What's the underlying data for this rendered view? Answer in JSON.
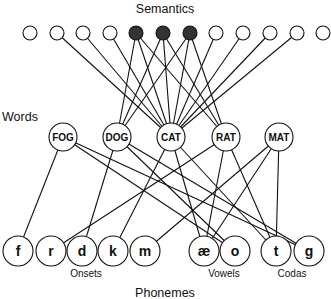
{
  "labels": {
    "semantics": "Semantics",
    "words": "Words",
    "phonemes": "Phonemes",
    "onsets": "Onsets",
    "vowels": "Vowels",
    "codas": "Codas"
  },
  "colors": {
    "line": "#111111",
    "node_fill": "#ffffff",
    "active_fill": "#333333"
  },
  "semantic_units": [
    {
      "id": "s1",
      "x": 30,
      "active": false
    },
    {
      "id": "s2",
      "x": 57,
      "active": false
    },
    {
      "id": "s3",
      "x": 83,
      "active": false
    },
    {
      "id": "s4",
      "x": 110,
      "active": false
    },
    {
      "id": "s5",
      "x": 136,
      "active": true
    },
    {
      "id": "s6",
      "x": 163,
      "active": true
    },
    {
      "id": "s7",
      "x": 190,
      "active": true
    },
    {
      "id": "s8",
      "x": 216,
      "active": false
    },
    {
      "id": "s9",
      "x": 243,
      "active": false
    },
    {
      "id": "s10",
      "x": 270,
      "active": false
    },
    {
      "id": "s11",
      "x": 297,
      "active": false
    },
    {
      "id": "s12",
      "x": 323,
      "active": false
    }
  ],
  "words": [
    {
      "id": "FOG",
      "label": "FOG",
      "x": 63
    },
    {
      "id": "DOG",
      "label": "DOG",
      "x": 117
    },
    {
      "id": "CAT",
      "label": "CAT",
      "x": 171
    },
    {
      "id": "RAT",
      "label": "RAT",
      "x": 226
    },
    {
      "id": "MAT",
      "label": "MAT",
      "x": 279
    }
  ],
  "phonemes": [
    {
      "id": "f",
      "label": "f",
      "x": 18,
      "group": "Onsets"
    },
    {
      "id": "r",
      "label": "r",
      "x": 51,
      "group": "Onsets"
    },
    {
      "id": "d",
      "label": "d",
      "x": 82,
      "group": "Onsets"
    },
    {
      "id": "k",
      "label": "k",
      "x": 113,
      "group": "Onsets"
    },
    {
      "id": "m",
      "label": "m",
      "x": 145,
      "group": "Onsets"
    },
    {
      "id": "ae",
      "label": "æ",
      "x": 204,
      "group": "Vowels"
    },
    {
      "id": "o",
      "label": "o",
      "x": 235,
      "group": "Vowels"
    },
    {
      "id": "t",
      "label": "t",
      "x": 276,
      "group": "Codas"
    },
    {
      "id": "g",
      "label": "g",
      "x": 309,
      "group": "Codas"
    }
  ],
  "semantic_word_edges": [
    [
      "s2",
      "CAT"
    ],
    [
      "s3",
      "CAT"
    ],
    [
      "s4",
      "CAT"
    ],
    [
      "s5",
      "DOG"
    ],
    [
      "s5",
      "CAT"
    ],
    [
      "s5",
      "RAT"
    ],
    [
      "s6",
      "DOG"
    ],
    [
      "s6",
      "CAT"
    ],
    [
      "s6",
      "RAT"
    ],
    [
      "s7",
      "DOG"
    ],
    [
      "s7",
      "CAT"
    ],
    [
      "s7",
      "RAT"
    ],
    [
      "s8",
      "CAT"
    ],
    [
      "s9",
      "CAT"
    ],
    [
      "s10",
      "CAT"
    ],
    [
      "s11",
      "CAT"
    ]
  ],
  "word_phoneme_edges": [
    [
      "FOG",
      "f"
    ],
    [
      "FOG",
      "o"
    ],
    [
      "FOG",
      "g"
    ],
    [
      "DOG",
      "d"
    ],
    [
      "DOG",
      "o"
    ],
    [
      "DOG",
      "g"
    ],
    [
      "CAT",
      "k"
    ],
    [
      "CAT",
      "ae"
    ],
    [
      "CAT",
      "t"
    ],
    [
      "RAT",
      "r"
    ],
    [
      "RAT",
      "ae"
    ],
    [
      "RAT",
      "t"
    ],
    [
      "MAT",
      "m"
    ],
    [
      "MAT",
      "ae"
    ],
    [
      "MAT",
      "t"
    ]
  ]
}
